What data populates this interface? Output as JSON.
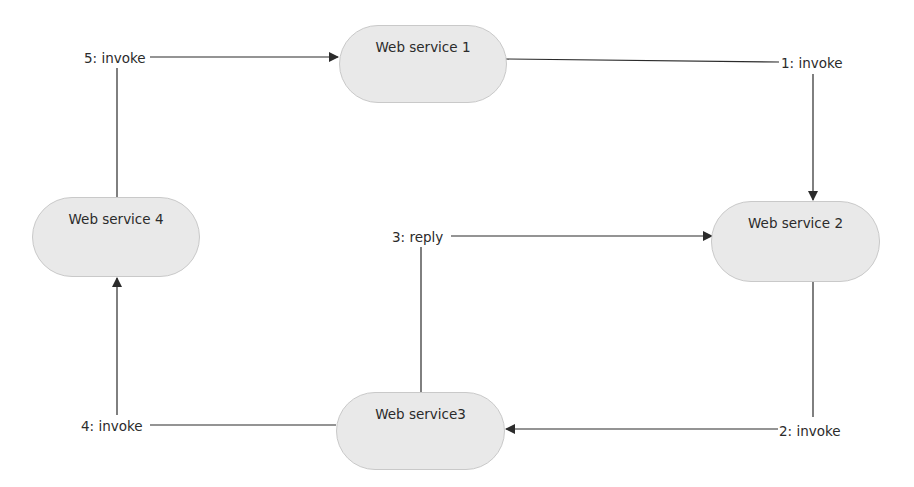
{
  "diagram": {
    "nodes": [
      {
        "id": "ws1",
        "label": "Web service 1"
      },
      {
        "id": "ws2",
        "label": "Web service 2"
      },
      {
        "id": "ws3",
        "label": "Web service3"
      },
      {
        "id": "ws4",
        "label": "Web service 4"
      }
    ],
    "edges": [
      {
        "from": "ws1",
        "to": "ws2",
        "label": "1: invoke"
      },
      {
        "from": "ws2",
        "to": "ws3",
        "label": "2: invoke"
      },
      {
        "from": "ws3",
        "to": "ws2",
        "label": "3: reply"
      },
      {
        "from": "ws3",
        "to": "ws4",
        "label": "4: invoke"
      },
      {
        "from": "ws4",
        "to": "ws1",
        "label": "5: invoke"
      }
    ],
    "colors": {
      "node_fill": "#e9e9e9",
      "node_border": "#c9c9c9",
      "edge": "#2b2b2b",
      "text": "#2b2b2b"
    }
  }
}
